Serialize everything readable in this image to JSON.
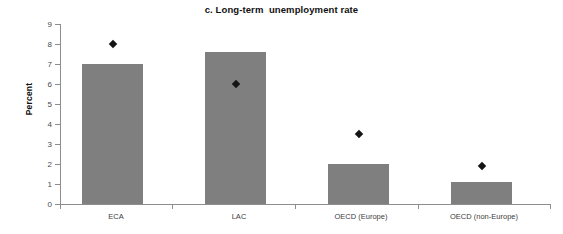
{
  "chart_data": {
    "type": "bar",
    "title": "c. Long-term  unemployment rate",
    "xlabel": "",
    "ylabel": "Percent",
    "ylim": [
      0,
      9
    ],
    "ytick_labels": [
      "0",
      "1",
      "2",
      "3",
      "4",
      "5",
      "6",
      "7",
      "8",
      "9"
    ],
    "ytick_values": [
      0,
      1,
      2,
      3,
      4,
      5,
      6,
      7,
      8,
      9
    ],
    "grid": false,
    "legend": "none",
    "categories": [
      "ECA",
      "LAC",
      "OECD (Europe)",
      "OECD (non-Europe)"
    ],
    "series": [
      {
        "name": "bars",
        "type": "bar",
        "values": [
          7.0,
          7.6,
          2.0,
          1.1
        ],
        "color": "#7f7f7f"
      },
      {
        "name": "markers",
        "type": "scatter",
        "marker": "diamond",
        "values": [
          8.0,
          6.0,
          3.5,
          1.9
        ],
        "color": "#151515"
      }
    ]
  },
  "geometry": {
    "baseline_y": 204,
    "px_per_unit": 20,
    "bars": [
      {
        "left": 82,
        "width": 61,
        "center": 112.5
      },
      {
        "left": 205,
        "width": 61,
        "center": 235.5
      },
      {
        "left": 328,
        "width": 61,
        "center": 358.5
      },
      {
        "left": 451,
        "width": 61,
        "center": 481.5
      }
    ],
    "xtick_positions": [
      60,
      172,
      295,
      418,
      550
    ],
    "label_centers": [
      116,
      239,
      361,
      484
    ]
  }
}
